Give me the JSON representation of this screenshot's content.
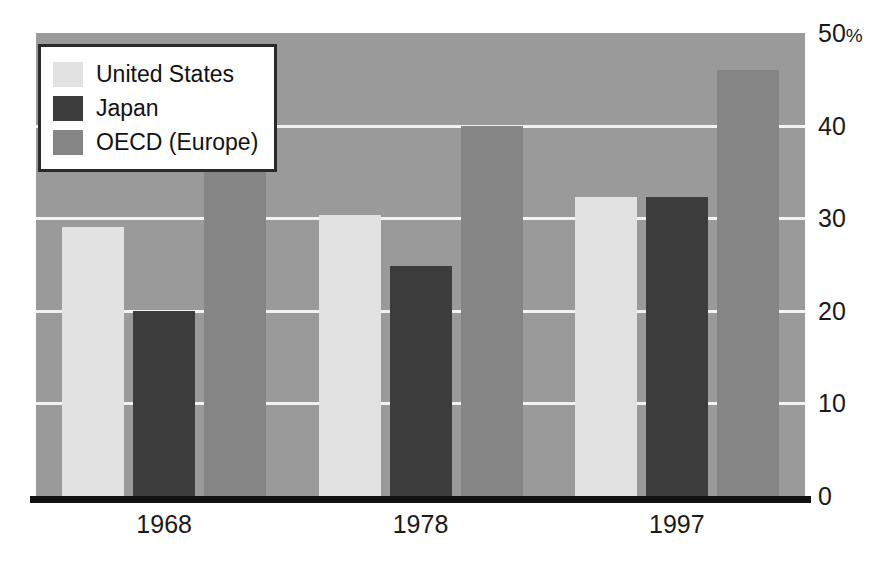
{
  "chart_data": {
    "type": "bar",
    "title": "",
    "subtitle": "",
    "xlabel": "",
    "ylabel": "",
    "categories": [
      "1968",
      "1978",
      "1997"
    ],
    "series": [
      {
        "name": "United States",
        "color": "#e2e2e2",
        "values": [
          29.0,
          30.3,
          32.3
        ]
      },
      {
        "name": "Japan",
        "color": "#3c3c3c",
        "values": [
          20.0,
          24.8,
          32.3
        ]
      },
      {
        "name": "OECD (Europe)",
        "color": "#858585",
        "values": [
          36.0,
          40.0,
          46.0
        ]
      }
    ],
    "ylim": [
      0,
      50
    ],
    "y_ticks": [
      {
        "value": 50,
        "label": "50",
        "suffix": "%"
      },
      {
        "value": 40,
        "label": "40",
        "suffix": ""
      },
      {
        "value": 30,
        "label": "30",
        "suffix": ""
      },
      {
        "value": 20,
        "label": "20",
        "suffix": ""
      },
      {
        "value": 10,
        "label": "10",
        "suffix": ""
      },
      {
        "value": 0,
        "label": "0",
        "suffix": ""
      }
    ],
    "grid": true,
    "gridline_values": [
      40,
      30,
      20,
      10
    ],
    "legend_position": "top-left",
    "plot_background": "#9a9a9a",
    "gridline_color": "#f2f2f2",
    "axis_color": "#111111"
  },
  "legend": {
    "items": [
      {
        "label": "United States",
        "color": "#e2e2e2"
      },
      {
        "label": "Japan",
        "color": "#3c3c3c"
      },
      {
        "label": "OECD (Europe)",
        "color": "#858585"
      }
    ]
  }
}
